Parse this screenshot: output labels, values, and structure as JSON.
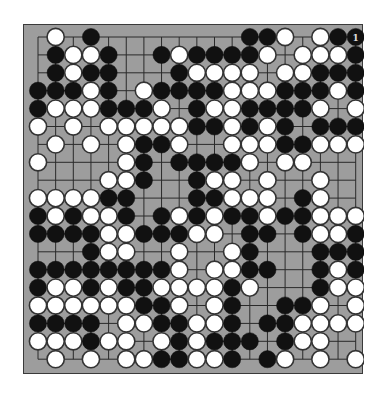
{
  "board": {
    "size": 19,
    "colors": {
      "background": "#9d9d9d",
      "grid": "#2a2a2a",
      "black": "#111111",
      "white": "#ffffff",
      "stone_outline": "#333333",
      "label_on_black": "#dddddd"
    },
    "rows": [
      ".W.B........BBW.WBB",
      ".BWWB..BWBBBBW.WWWB",
      ".BWBB...BWWWW.WWBBB",
      "BBBWB.WBBBBWWWBBBWB",
      "BWWWBBBW.BWWBBBBW.W",
      "W.W.WWWWWBBWBWB.BBB",
      ".W.W.WBBW..WWWBBWWW",
      "W....WB.BBBBW.WW...",
      "....WWB..BWW.W..W..",
      "WWWWBB...BBWWW.BW..",
      "BWBWWB.BWBWBBWBBWWW",
      "BBBBWWBBBWW.BB.BWWB",
      "...BWW..W..WB...BBB",
      "BBBBBBBBW.WWBB..BWB",
      "BWWBWBBWWWWBW...BWW",
      "WWWWWWBBW.WB..BBW.W",
      "BBBB.WWBBWWB.BBWWWW",
      "WWWBWW.WBWBBB.BWW..",
      ".W.W.WWBBWWB.BW.W.W"
    ],
    "labels": [
      {
        "row": 0,
        "col": 18,
        "text": "1"
      }
    ]
  }
}
